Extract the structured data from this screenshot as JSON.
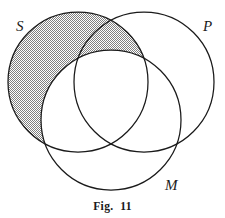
{
  "figure": {
    "caption": "Fig.  11",
    "type": "venn-diagram",
    "set_count": 3,
    "background_color": "#ffffff",
    "stroke_color": "#1a1a1a",
    "shade_color": "#a0a0a0",
    "shade_style": "checkerboard-dither-50"
  },
  "sets": [
    {
      "id": "S",
      "label": "S",
      "center_x": 78,
      "center_y": 82,
      "radius": 70,
      "label_x": 16,
      "label_y": 31
    },
    {
      "id": "P",
      "label": "P",
      "center_x": 144,
      "center_y": 82,
      "radius": 70,
      "label_x": 203,
      "label_y": 31
    },
    {
      "id": "M",
      "label": "M",
      "center_x": 111,
      "center_y": 120,
      "radius": 70,
      "label_x": 165,
      "label_y": 190
    }
  ],
  "shaded_regions": [
    {
      "id": "S-minus-M",
      "description": "S not M",
      "shaded": true
    }
  ],
  "unshaded_regions": [
    {
      "id": "S-and-M",
      "description": "S and M",
      "shaded": false
    },
    {
      "id": "S-and-P-and-M",
      "description": "S and P and M",
      "shaded": false
    },
    {
      "id": "P-only",
      "description": "P only",
      "shaded": false
    },
    {
      "id": "P-and-M",
      "description": "P and M",
      "shaded": false
    },
    {
      "id": "M-only",
      "description": "M only",
      "shaded": false
    }
  ]
}
